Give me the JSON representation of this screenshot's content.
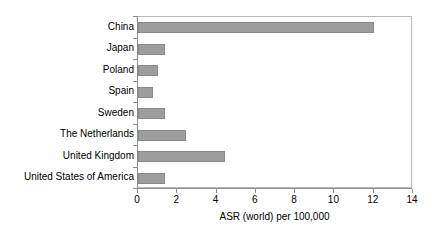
{
  "chart_data": {
    "type": "bar",
    "orientation": "horizontal",
    "title": "",
    "xlabel": "ASR (world) per 100,000",
    "ylabel": "",
    "categories": [
      "China",
      "Japan",
      "Poland",
      "Spain",
      "Sweden",
      "The Netherlands",
      "United Kingdom",
      "United States of America"
    ],
    "values": [
      12.0,
      1.35,
      1.0,
      0.75,
      1.35,
      2.45,
      4.45,
      1.35
    ],
    "xlim": [
      0,
      14
    ],
    "xticks": [
      0,
      2,
      4,
      6,
      8,
      10,
      12,
      14
    ],
    "xtick_labels": [
      "0",
      "2",
      "4",
      "6",
      "8",
      "10",
      "12",
      "14"
    ],
    "grid": false,
    "legend": null,
    "bar_color": "#9d9d9d",
    "bar_border_color": "#8a8a8a",
    "axis_color": "#8c8c8c",
    "frame_color": "#b9b9b9",
    "background": "#ffffff"
  }
}
